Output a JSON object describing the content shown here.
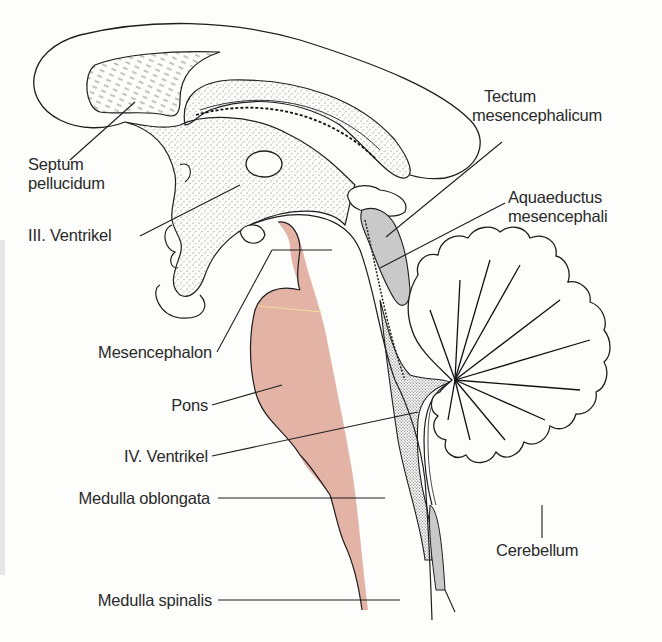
{
  "figure": {
    "colors": {
      "background": "#fdfdfc",
      "outline": "#1e1e1e",
      "brainstem_fill": "#e3b3a6",
      "aqueduct_fill": "#c9c9c9",
      "stipple": "#555555",
      "label_text": "#2a2a2a"
    }
  },
  "labels": {
    "septum": {
      "line1": "Septum",
      "line2": "pellucidum"
    },
    "ventricle3": {
      "text": "III. Ventrikel"
    },
    "tectum": {
      "line1": "Tectum",
      "line2": "mesencephalicum"
    },
    "aqueduct": {
      "line1": "Aquaeductus",
      "line2": "mesencephali"
    },
    "mesencephalon": {
      "text": "Mesencephalon"
    },
    "pons": {
      "text": "Pons"
    },
    "ventricle4": {
      "text": "IV. Ventrikel"
    },
    "medulla_oblongata": {
      "text": "Medulla oblongata"
    },
    "cerebellum": {
      "text": "Cerebellum"
    },
    "medulla_spinalis": {
      "text": "Medulla spinalis"
    }
  }
}
